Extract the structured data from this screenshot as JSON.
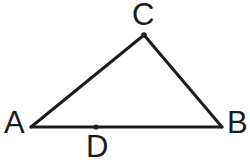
{
  "figure": {
    "kind": "geometry-diagram",
    "background_color": "#ffffff",
    "stroke_color": "#1c1c1c",
    "stroke_width": 3,
    "labels": {
      "a": "A",
      "b": "B",
      "c": "C",
      "d": "D"
    },
    "points": {
      "A": {
        "x": 31,
        "y": 127
      },
      "B": {
        "x": 222,
        "y": 127
      },
      "C": {
        "x": 144,
        "y": 35
      },
      "D": {
        "x": 96,
        "y": 127
      }
    },
    "segments": [
      {
        "name": "AB",
        "from": "A",
        "to": "B"
      },
      {
        "name": "AC",
        "from": "A",
        "to": "C"
      },
      {
        "name": "BC",
        "from": "B",
        "to": "C"
      }
    ],
    "marked_points": [
      {
        "name": "C",
        "radius": 2.8
      },
      {
        "name": "D",
        "radius": 2.6
      }
    ]
  }
}
